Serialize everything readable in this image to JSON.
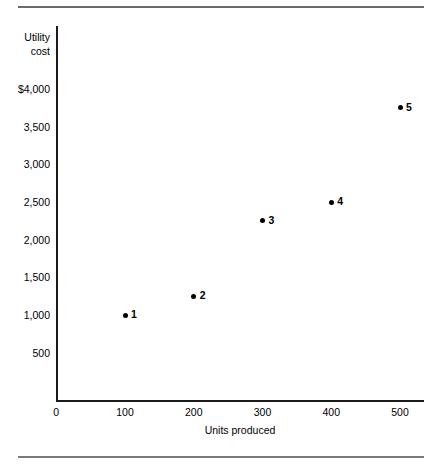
{
  "figure": {
    "top_rule": "horizontal-rule",
    "bottom_rule": "horizontal-rule"
  },
  "chart_data": {
    "type": "scatter",
    "title": "",
    "xlabel": "Units produced",
    "ylabel": "Utility cost",
    "ylabel_line1": "Utility",
    "ylabel_line2": "cost",
    "xlim": [
      0,
      550
    ],
    "ylim": [
      0,
      4250
    ],
    "grid": false,
    "legend": "none",
    "xticks": [
      "0",
      "100",
      "200",
      "300",
      "400",
      "500"
    ],
    "xtick_values": [
      0,
      100,
      200,
      300,
      400,
      500
    ],
    "yticks": [
      "500",
      "1,000",
      "1,500",
      "2,000",
      "2,500",
      "3,000",
      "3,500",
      "$4,000"
    ],
    "ytick_values": [
      500,
      1000,
      1500,
      2000,
      2500,
      3000,
      3500,
      4000
    ],
    "points": [
      {
        "label": "1",
        "x": 100,
        "y": 1000
      },
      {
        "label": "2",
        "x": 200,
        "y": 1250
      },
      {
        "label": "3",
        "x": 300,
        "y": 2250
      },
      {
        "label": "4",
        "x": 400,
        "y": 2500
      },
      {
        "label": "5",
        "x": 500,
        "y": 3750
      }
    ]
  }
}
